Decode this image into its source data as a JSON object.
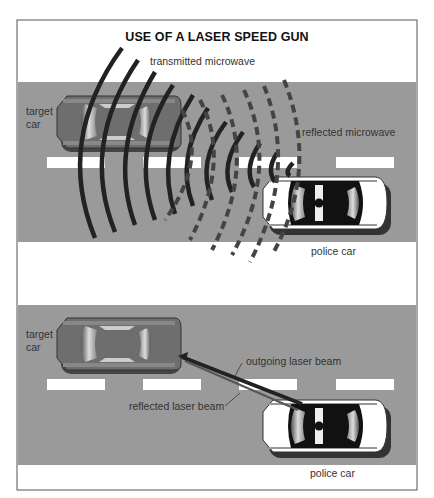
{
  "title": "USE OF A LASER SPEED GUN",
  "colors": {
    "road": "#9a9a9a",
    "frame": "#555555",
    "wave": "#222222",
    "target_car": "#6e6e6e",
    "police_car": "#ffffff"
  },
  "top_scene": {
    "labels": {
      "transmitted": "transmitted microwave",
      "reflected": "reflected microwave",
      "target_car": [
        "target",
        "car"
      ],
      "police_car": "police car"
    }
  },
  "bottom_scene": {
    "labels": {
      "outgoing": "outgoing laser beam",
      "reflected": "reflected laser beam",
      "target_car": [
        "target",
        "car"
      ],
      "police_car": "police car"
    }
  }
}
